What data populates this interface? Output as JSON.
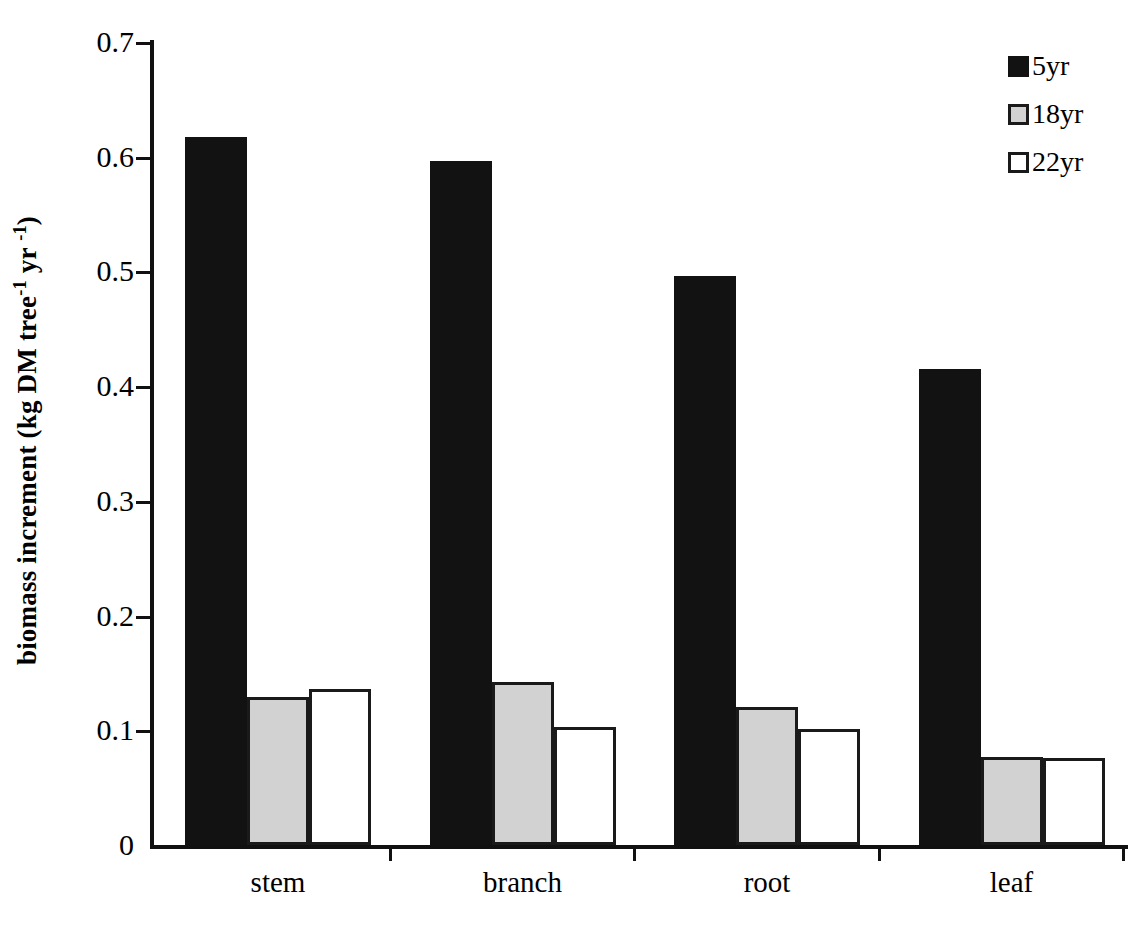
{
  "chart_data": {
    "type": "bar",
    "title": "",
    "subtitle": "",
    "xlabel": "",
    "ylabel": "biomass increment (kg DM tree-1 yr -1)",
    "ylabel_parts": {
      "prefix": "biomass increment (kg DM tree",
      "sup1": "-1",
      "middle": " yr ",
      "sup2": "-1",
      "suffix": ")"
    },
    "categories": [
      "stem",
      "branch",
      "root",
      "leaf"
    ],
    "series": [
      {
        "name": "5yr",
        "color": "#121212",
        "values": [
          0.617,
          0.596,
          0.496,
          0.415
        ]
      },
      {
        "name": "18yr",
        "color": "#d2d2d2",
        "values": [
          0.129,
          0.142,
          0.12,
          0.077
        ]
      },
      {
        "name": "22yr",
        "color": "#ffffff",
        "values": [
          0.136,
          0.103,
          0.101,
          0.076
        ]
      }
    ],
    "ylim": [
      0,
      0.7
    ],
    "yticks": [
      0,
      0.1,
      0.2,
      0.3,
      0.4,
      0.5,
      0.6,
      0.7
    ],
    "ytick_labels": [
      "0",
      "0.1",
      "0.2",
      "0.3",
      "0.4",
      "0.5",
      "0.6",
      "0.7"
    ],
    "grid": false,
    "legend_position": "top-right",
    "legend_entries": [
      "5yr",
      "18yr",
      "22yr"
    ]
  }
}
